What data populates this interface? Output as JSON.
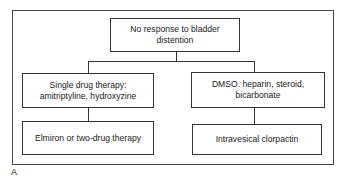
{
  "diagram": {
    "type": "flowchart",
    "root": {
      "id": "root",
      "text": "No response to bladder distention"
    },
    "branches": [
      {
        "id": "left",
        "text": "Single drug therapy: amitriptyline, hydroxyzine",
        "child": {
          "id": "left-child",
          "text": "Elmiron or two-drug therapy"
        }
      },
      {
        "id": "right",
        "text": "DMSO. heparin, steroid, bicarbonate",
        "child": {
          "id": "right-child",
          "text": "Intravesical clorpactin"
        }
      }
    ],
    "panel_label": "A"
  }
}
